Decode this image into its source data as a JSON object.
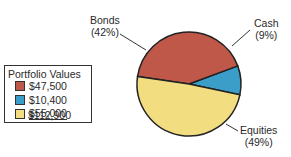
{
  "chart_data": {
    "type": "pie",
    "title": "",
    "legend_title": "Portfolio Values",
    "legend_position": "left",
    "slices": [
      {
        "name": "Bonds",
        "percent": 42,
        "value": 47500,
        "value_label": "$47,500",
        "color": "#c0584a"
      },
      {
        "name": "Cash",
        "percent": 9,
        "value": 10400,
        "value_label": "$10,400",
        "color": "#3a9ec9"
      },
      {
        "name": "Equities",
        "percent": 49,
        "value": 55000,
        "value_label": "$55,000",
        "color": "#f2dd80"
      }
    ],
    "total_label": "$112,900",
    "labels": {
      "bonds": {
        "name": "Bonds",
        "pct": "(42%)"
      },
      "cash": {
        "name": "Cash",
        "pct": "(9%)"
      },
      "equities": {
        "name": "Equities",
        "pct": "(49%)"
      }
    }
  }
}
